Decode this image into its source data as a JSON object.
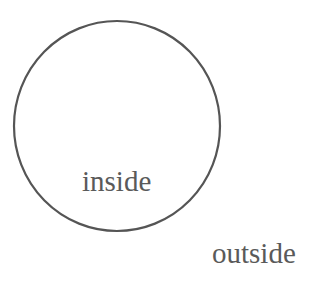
{
  "diagram": {
    "type": "venn-single-set",
    "shapes": [
      {
        "kind": "circle",
        "cx": 117,
        "cy": 126,
        "rx": 103,
        "ry": 105,
        "stroke": "#555555",
        "stroke_width": 2,
        "fill": "none"
      }
    ],
    "labels": {
      "inside": "inside",
      "outside": "outside"
    },
    "colors": {
      "background": "#ffffff",
      "stroke": "#555555",
      "text": "#5a5a5a"
    }
  }
}
